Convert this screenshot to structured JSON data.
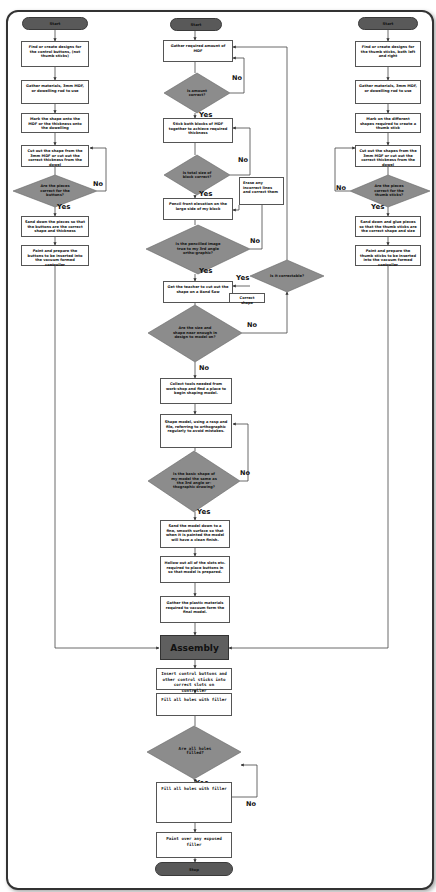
{
  "colors": {
    "decision_fill": "#8c8c8c",
    "terminal_fill": "#595959",
    "assembly_fill": "#5f5f5f",
    "line": "#444444",
    "box_border": "#555555"
  },
  "left_column": {
    "start": "Start",
    "steps": [
      "Find or create designs for the control buttons, (not thumb sticks)",
      "Gather materials, 3mm MDF, or dowelling rod to use",
      "Mark the shape onto the MDF or the thickness onto the dowelling",
      "Cut out the shape from the 3mm MDF or cut out the correct thickness from the dowel"
    ],
    "decision": "Are the pieces correct for the buttons?",
    "decision_yes": "Yes",
    "decision_no": "No",
    "after_steps": [
      "Sand down the pieces so that the buttons are the correct shape and thickness",
      "Paint and prepare the buttons to be inserted into the vacuum formed controller"
    ]
  },
  "middle_column": {
    "start": "Start",
    "step_gather": "Gather required amount of MDF",
    "decision_amount": "Is amount correct?",
    "decision_amount_yes": "Yes",
    "decision_amount_no": "No",
    "step_stick": "Stick both blocks of MDF together to achieve required thickness",
    "decision_total": "Is total size of block correct?",
    "decision_total_yes": "Yes",
    "decision_total_no": "No",
    "step_pencil": "Pencil front elevation on the large side of my block",
    "step_erase": "Erase any incorrect lines and correct them",
    "decision_penciled": "Is the pencilled image true to my 3rd angle ortho-graphic?",
    "decision_penciled_yes": "Yes",
    "decision_penciled_no": "No",
    "step_teacher": "Get the teacher to cut out the shape on a Band Saw",
    "step_correct_shape": "Correct shape",
    "decision_correctable": "Is it correctable?",
    "decision_correctable_yes": "Yes",
    "decision_size": "Are the size and shape near enough in design to model on?",
    "decision_size_no_right": "No",
    "decision_size_no_down": "No",
    "step_collect": "Collect tools needed from work-shop and find a place to begin shaping model.",
    "step_shape": "Shape model, using a rasp and file, referring to orthographic regularly to avoid mistakes.",
    "decision_basic": "Is the basic shape of my model the same as the 3rd angle or-thographic drawing?",
    "decision_basic_yes": "Yes",
    "decision_basic_no": "No",
    "step_sand": "Sand the model down to a fine, smooth surface so that when it is painted the model will have a clean finish.",
    "step_hollow": "Hollow out all of the slots etc. required to place buttons in so that model is prepared.",
    "step_plastic": "Gather the plastic materials required to vacuum form the final model.",
    "assembly": "Assembly",
    "step_insert": "Insert control buttons and other control sticks into correct slots on controller",
    "step_fill1": "Fill all holes with filler",
    "decision_holes": "Are all holes filled?",
    "decision_holes_yes": "Yes",
    "decision_holes_no": "No",
    "step_fill2": "Fill all holes with filler",
    "step_paint": "Paint over any exposed filler",
    "stop": "Stop"
  },
  "right_column": {
    "start": "Start",
    "steps": [
      "Find or create designs for the thumb sticks, both left and right",
      "Gather materials, 3mm MDF, or dowelling rod to use",
      "Mark on the different shapes required to create a thumb stick",
      "Cut out the shapes from the 3mm MDF or cut out the correct thickness from the dowel"
    ],
    "decision": "Are the pieces correct for the thumb sticks?",
    "decision_yes": "Yes",
    "decision_no": "No",
    "after_steps": [
      "Sand down and glue pieces so that the thumb sticks are the correct shape and size",
      "Paint and prepare the thumb sticks to be inserted into the vacuum formed controller"
    ]
  }
}
